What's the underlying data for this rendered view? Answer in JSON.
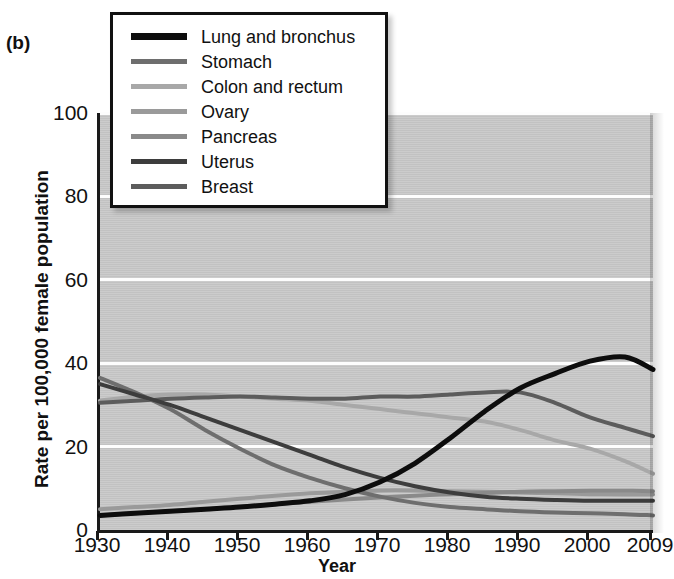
{
  "panel_label": "(b)",
  "axes": {
    "ylabel": "Rate per 100,000 female population",
    "xlabel": "Year",
    "yticks": [
      "0",
      "20",
      "40",
      "60",
      "80",
      "100"
    ],
    "xticks": [
      "1930",
      "1940",
      "1950",
      "1960",
      "1970",
      "1980",
      "1990",
      "2000",
      "2009"
    ],
    "ylim": [
      0,
      100
    ],
    "xlim": [
      1930,
      2009
    ],
    "grid": "horizontal-white",
    "plot_background": "#c9c9c9",
    "axis_color": "#1a1a1a"
  },
  "legend": {
    "position": "top-left-inside",
    "entries": [
      {
        "label": "Lung and bronchus",
        "color": "#0d0d0d"
      },
      {
        "label": "Stomach",
        "color": "#6e6e6e"
      },
      {
        "label": "Colon and rectum",
        "color": "#a8a8a8"
      },
      {
        "label": "Ovary",
        "color": "#9a9a9a"
      },
      {
        "label": "Pancreas",
        "color": "#8a8a8a"
      },
      {
        "label": "Uterus",
        "color": "#3d3d3d"
      },
      {
        "label": "Breast",
        "color": "#5c5c5c"
      }
    ]
  },
  "chart_data": {
    "type": "line",
    "title": "",
    "subtitle": "",
    "xlabel": "Year",
    "ylabel": "Rate per 100,000 female population",
    "xlim": [
      1930,
      2009
    ],
    "ylim": [
      0,
      100
    ],
    "grid": true,
    "legend_position": "upper-left",
    "x": [
      1930,
      1935,
      1940,
      1945,
      1950,
      1955,
      1960,
      1965,
      1970,
      1975,
      1980,
      1985,
      1990,
      1995,
      2000,
      2005,
      2009
    ],
    "series": [
      {
        "name": "Lung and bronchus",
        "color": "#0d0d0d",
        "values": [
          3.5,
          4.0,
          4.5,
          5.0,
          5.5,
          6.2,
          7.0,
          8.5,
          11.5,
          16.0,
          22.0,
          28.5,
          34.0,
          37.5,
          40.5,
          41.5,
          38.5
        ]
      },
      {
        "name": "Stomach",
        "color": "#6e6e6e",
        "values": [
          36.5,
          33.0,
          29.0,
          24.0,
          19.5,
          15.5,
          12.5,
          10.0,
          8.0,
          6.5,
          5.5,
          5.0,
          4.5,
          4.2,
          4.0,
          3.8,
          3.5
        ]
      },
      {
        "name": "Colon and rectum",
        "color": "#a8a8a8",
        "values": [
          31.0,
          32.0,
          32.5,
          32.5,
          32.0,
          31.5,
          31.0,
          30.0,
          29.0,
          28.0,
          27.0,
          26.0,
          24.0,
          21.5,
          19.5,
          16.5,
          13.5
        ]
      },
      {
        "name": "Ovary",
        "color": "#9a9a9a",
        "values": [
          5.0,
          5.5,
          6.0,
          6.8,
          7.5,
          8.2,
          8.8,
          9.2,
          9.5,
          9.5,
          9.3,
          9.2,
          9.0,
          8.8,
          8.6,
          8.5,
          8.5
        ]
      },
      {
        "name": "Pancreas",
        "color": "#8a8a8a",
        "values": [
          3.5,
          4.0,
          4.5,
          5.0,
          5.6,
          6.2,
          6.8,
          7.3,
          7.8,
          8.2,
          8.6,
          8.9,
          9.2,
          9.3,
          9.4,
          9.4,
          9.3
        ]
      },
      {
        "name": "Uterus",
        "color": "#3d3d3d",
        "values": [
          35.0,
          32.5,
          30.0,
          27.0,
          24.0,
          21.0,
          18.0,
          15.0,
          12.5,
          10.5,
          9.0,
          8.0,
          7.5,
          7.2,
          7.0,
          7.0,
          7.0
        ]
      },
      {
        "name": "Breast",
        "color": "#5c5c5c",
        "values": [
          30.5,
          31.0,
          31.5,
          31.8,
          32.0,
          31.8,
          31.5,
          31.5,
          32.0,
          32.0,
          32.5,
          33.0,
          33.0,
          30.5,
          27.0,
          24.5,
          22.5
        ]
      }
    ]
  }
}
